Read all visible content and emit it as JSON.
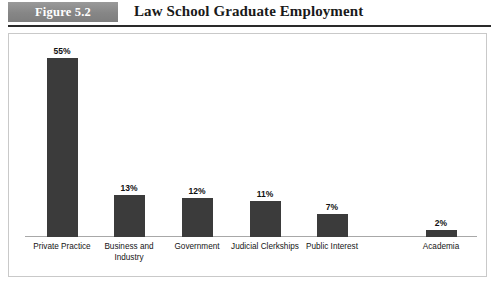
{
  "header": {
    "figure_tag": "Figure 5.2",
    "title": "Law School Graduate Employment",
    "tag_bg_color": "#8c8c8c",
    "rule_color": "#2a2a2a"
  },
  "chart_data": {
    "type": "bar",
    "title": "Law School Graduate Employment",
    "xlabel": "",
    "ylabel": "",
    "ylim": [
      0,
      60
    ],
    "grid": false,
    "legend": false,
    "bar_color": "#3b3b3b",
    "value_suffix": "%",
    "categories": [
      "Private Practice",
      "Business and Industry",
      "Government",
      "Judicial Clerkships",
      "Public Interest",
      "Academia"
    ],
    "values": [
      55,
      13,
      12,
      11,
      7,
      2
    ],
    "value_labels": [
      "55%",
      "13%",
      "12%",
      "11%",
      "7%",
      "2%"
    ],
    "bars": [
      {
        "category": "Private Practice",
        "value": 55,
        "label": "55%",
        "center_x": 61
      },
      {
        "category": "Business and Industry",
        "value": 13,
        "label": "13%",
        "center_x": 128
      },
      {
        "category": "Government",
        "value": 12,
        "label": "12%",
        "center_x": 196
      },
      {
        "category": "Judicial Clerkships",
        "value": 11,
        "label": "11%",
        "center_x": 264
      },
      {
        "category": "Public Interest",
        "value": 7,
        "label": "7%",
        "center_x": 331
      },
      {
        "category": "Academia",
        "value": 2,
        "label": "2%",
        "center_x": 440
      }
    ]
  }
}
